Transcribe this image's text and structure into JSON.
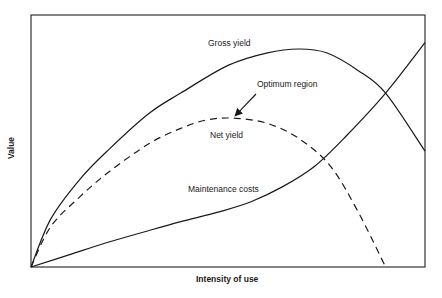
{
  "chart_data": {
    "type": "line",
    "title": "",
    "xlabel": "Intensity of use",
    "ylabel": "Value",
    "xlim": [
      0,
      100
    ],
    "ylim": [
      0,
      100
    ],
    "grid": false,
    "ticks": "none",
    "legend": "none (curves labelled inline)",
    "series": [
      {
        "name": "Gross yield",
        "style": "solid",
        "x": [
          0,
          5,
          12.5,
          20,
          30,
          38,
          50,
          60,
          68,
          75,
          83,
          90,
          100
        ],
        "y": [
          0,
          19,
          35,
          47,
          61,
          69,
          80,
          85,
          86.5,
          85,
          78,
          69,
          46
        ]
      },
      {
        "name": "Net yield",
        "style": "dashed",
        "x": [
          0,
          5,
          12.5,
          20,
          30,
          38,
          45,
          52,
          60,
          68,
          76,
          83,
          90
        ],
        "y": [
          0,
          16,
          28,
          38,
          49,
          55,
          58.5,
          59,
          57,
          51,
          40,
          22,
          0
        ]
      },
      {
        "name": "Maintenance costs",
        "style": "solid",
        "x": [
          0,
          10,
          20,
          30,
          38,
          48,
          56,
          64,
          72,
          80,
          90,
          100
        ],
        "y": [
          0,
          5,
          10,
          14.5,
          18,
          22,
          26,
          32,
          40,
          52,
          69,
          89
        ]
      }
    ],
    "annotations": [
      {
        "text": "Gross yield",
        "x": 50,
        "y": 95
      },
      {
        "text": "Optimum region",
        "x": 65,
        "y": 72,
        "arrow_to": [
          52,
          59.5
        ]
      },
      {
        "text": "Net yield",
        "x": 51,
        "y": 52
      },
      {
        "text": "Maintenance costs",
        "x": 40,
        "y": 30
      }
    ]
  },
  "labels": {
    "gross": "Gross yield",
    "optimum": "Optimum region",
    "net": "Net yield",
    "maintenance": "Maintenance costs",
    "xaxis": "Intensity of use",
    "yaxis": "Value"
  }
}
